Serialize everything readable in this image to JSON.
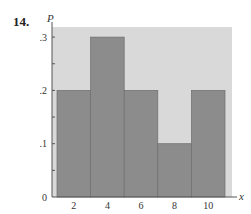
{
  "problem_number": "14.",
  "chart_data": {
    "type": "bar",
    "title": "",
    "xlabel": "x",
    "ylabel": "P",
    "categories": [
      "2",
      "4",
      "6",
      "8",
      "10"
    ],
    "x": [
      2,
      4,
      6,
      8,
      10
    ],
    "values": [
      0.2,
      0.3,
      0.2,
      0.1,
      0.2
    ],
    "ylim": [
      0,
      0.32
    ],
    "yticks": [
      {
        "value": 0,
        "label": "0"
      },
      {
        "value": 0.1,
        "label": ".1"
      },
      {
        "value": 0.2,
        "label": ".2"
      },
      {
        "value": 0.3,
        "label": ".3"
      }
    ],
    "minor_yticks": [
      0.05,
      0.15,
      0.25
    ],
    "xticks": [
      {
        "value": 2,
        "label": "2"
      },
      {
        "value": 4,
        "label": "4"
      },
      {
        "value": 6,
        "label": "6"
      },
      {
        "value": 8,
        "label": "8"
      },
      {
        "value": 10,
        "label": "10"
      }
    ],
    "grid": false,
    "legend": null,
    "colors": {
      "background": "#d9d9d9",
      "bar": "#8c8c8c",
      "bar_edge": "#6e6e6e",
      "axis": "#555555",
      "text": "#333333"
    }
  }
}
